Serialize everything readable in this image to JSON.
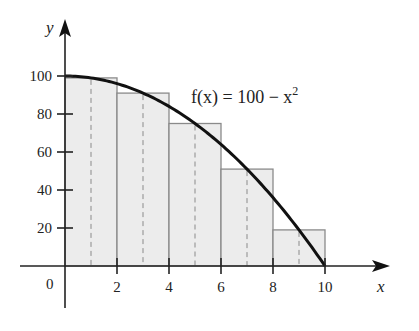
{
  "chart_data": {
    "type": "bar",
    "title": "",
    "xlabel": "x",
    "ylabel": "y",
    "xlim": [
      0,
      11.5
    ],
    "ylim": [
      0,
      110
    ],
    "grid": false,
    "x_ticks": [
      0,
      2,
      4,
      6,
      8,
      10
    ],
    "x_tick_labels": [
      "0",
      "2",
      "4",
      "6",
      "8",
      "10"
    ],
    "y_ticks": [
      20,
      40,
      60,
      80,
      100
    ],
    "y_tick_labels": [
      "20",
      "40",
      "60",
      "80",
      "100"
    ],
    "annotation": "f(x) = 100 − x²",
    "curve": {
      "name": "f(x) = 100 - x^2",
      "x": [
        0,
        1,
        2,
        3,
        4,
        5,
        6,
        7,
        8,
        9,
        10
      ],
      "y": [
        100,
        99,
        96,
        91,
        84,
        75,
        64,
        51,
        36,
        19,
        0
      ]
    },
    "rectangles": {
      "description": "Midpoint Riemann sum rectangles, width 2",
      "left_edges": [
        0,
        2,
        4,
        6,
        8
      ],
      "right_edges": [
        2,
        4,
        6,
        8,
        10
      ],
      "midpoints": [
        1,
        3,
        5,
        7,
        9
      ],
      "heights": [
        99,
        91,
        75,
        51,
        19
      ]
    }
  },
  "labels": {
    "x_axis": "x",
    "y_axis": "y",
    "function": "f(x) = 100 − x",
    "function_exp": "2",
    "origin": "0"
  }
}
